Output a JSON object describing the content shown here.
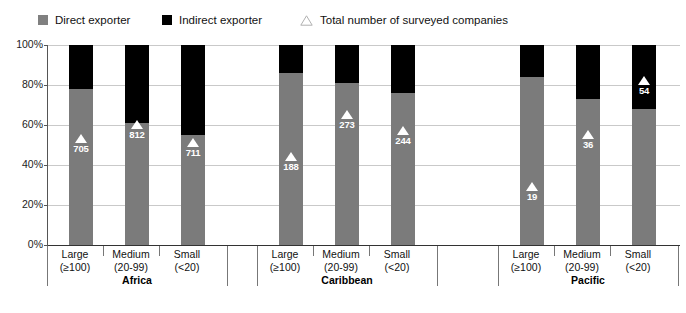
{
  "legend": {
    "items": [
      {
        "label": "Direct exporter",
        "icon": "square-swatch-gray",
        "color": "#808080"
      },
      {
        "label": "Indirect exporter",
        "icon": "square-swatch-black",
        "color": "#000000"
      },
      {
        "label": "Total number of surveyed companies",
        "icon": "triangle-outline-marker",
        "color": "#ffffff"
      }
    ]
  },
  "axis": {
    "y_ticks": [
      "100%",
      "80%",
      "60%",
      "40%",
      "20%",
      "0%"
    ],
    "y_values": [
      100,
      80,
      60,
      40,
      20,
      0
    ]
  },
  "groups": [
    {
      "name": "Africa",
      "categories": [
        {
          "size": "Large",
          "range": "(≥100)"
        },
        {
          "size": "Medium",
          "range": "(20-99)"
        },
        {
          "size": "Small",
          "range": "(<20)"
        }
      ]
    },
    {
      "name": "Caribbean",
      "categories": [
        {
          "size": "Large",
          "range": "(≥100)"
        },
        {
          "size": "Medium",
          "range": "(20-99)"
        },
        {
          "size": "Small",
          "range": "(<20)"
        }
      ]
    },
    {
      "name": "Pacific",
      "categories": [
        {
          "size": "Large",
          "range": "(≥100)"
        },
        {
          "size": "Medium",
          "range": "(20-99)"
        },
        {
          "size": "Small",
          "range": "(<20)"
        }
      ]
    }
  ],
  "chart_data": {
    "type": "bar",
    "subtype": "stacked-100-percent",
    "title": "",
    "xlabel": "",
    "ylabel": "",
    "ylim": [
      0,
      100
    ],
    "grid": true,
    "legend_position": "top-left",
    "categories": [
      "Africa / Large (≥100)",
      "Africa / Medium (20-99)",
      "Africa / Small (<20)",
      "Caribbean / Large (≥100)",
      "Caribbean / Medium (20-99)",
      "Caribbean / Small (<20)",
      "Pacific / Large (≥100)",
      "Pacific / Medium (20-99)",
      "Pacific / Small (<20)"
    ],
    "series": [
      {
        "name": "Direct exporter",
        "color": "#7b7b7b",
        "values": [
          78,
          61,
          55,
          86,
          81,
          76,
          84,
          73,
          68
        ]
      },
      {
        "name": "Indirect exporter",
        "color": "#000000",
        "values": [
          22,
          39,
          45,
          14,
          19,
          24,
          16,
          27,
          32
        ]
      }
    ],
    "markers": {
      "name": "Total number of surveyed companies",
      "color": "#ffffff",
      "labels": [
        "705",
        "812",
        "711",
        "188",
        "273",
        "244",
        "19",
        "36",
        "54"
      ],
      "values": [
        705,
        812,
        711,
        188,
        273,
        244,
        19,
        36,
        54
      ],
      "y_positions_pct": [
        53,
        60,
        51,
        44,
        65,
        57,
        29,
        55,
        82
      ]
    }
  }
}
